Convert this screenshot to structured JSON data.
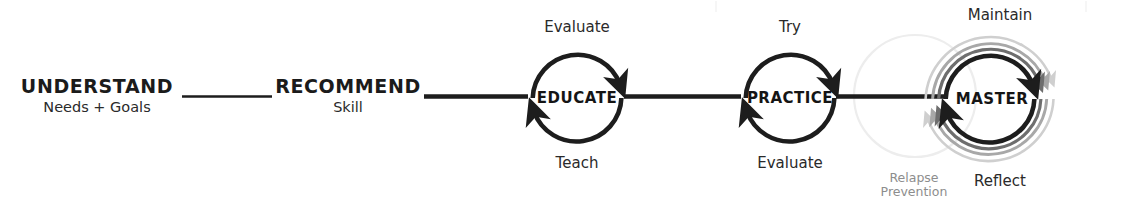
{
  "diagram": {
    "type": "process-flow",
    "orientation": "horizontal",
    "colors": {
      "ink": "#1d1d1d",
      "text": "#2a2a2a",
      "muted": "#8d8d8d",
      "echo_mid": "#6e6e6e",
      "echo_light": "#a8a8a8",
      "echo_faint": "#cfcfcf",
      "relapse_ring": "#ededed",
      "background": "#ffffff"
    },
    "text_stages": [
      {
        "id": "understand",
        "title": "UNDERSTAND",
        "subtitle": "Needs + Goals"
      },
      {
        "id": "recommend",
        "title": "RECOMMEND",
        "subtitle": "Skill"
      }
    ],
    "cycle_stages": [
      {
        "id": "educate",
        "label": "EDUCATE",
        "top_label": "Evaluate",
        "bottom_label": "Teach",
        "echo_rings": 0
      },
      {
        "id": "practice",
        "label": "PRACTICE",
        "top_label": "Try",
        "bottom_label": "Evaluate",
        "echo_rings": 0
      },
      {
        "id": "master",
        "label": "MASTER",
        "top_label": "Maintain",
        "bottom_label": "Reflect",
        "echo_rings": 3
      }
    ],
    "annotations": [
      {
        "id": "relapse-prevention",
        "line1": "Relapse",
        "line2": "Prevention"
      }
    ],
    "connectors": [
      {
        "id": "understand-to-recommend",
        "style": "thin-rule"
      },
      {
        "id": "recommend-to-educate",
        "style": "thick-rule"
      },
      {
        "id": "educate-to-practice",
        "style": "thick-rule"
      },
      {
        "id": "practice-to-master",
        "style": "thick-rule"
      }
    ]
  }
}
